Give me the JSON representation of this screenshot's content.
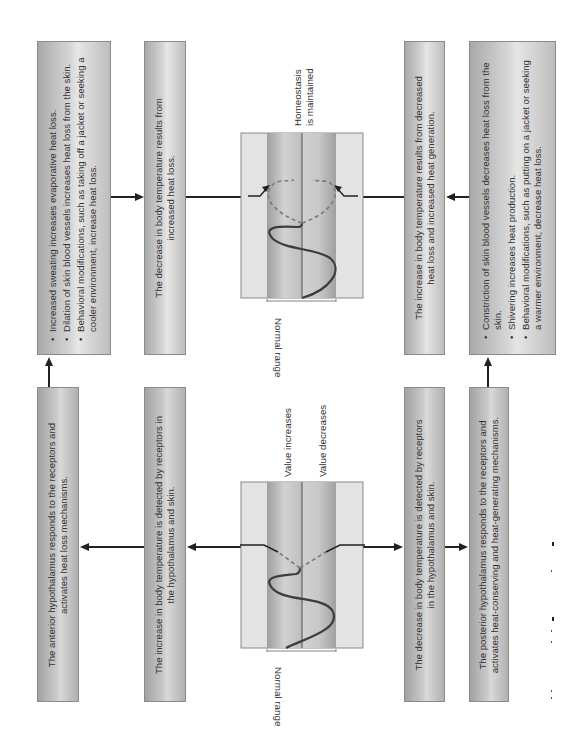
{
  "figure": {
    "left_column_top": {
      "response_box": {
        "bullets": [
          "Increased sweating increases evaporative heat loss.",
          "Dilation of skin blood vessels increases heat loss from the skin.",
          "Behavioral modifications, such as taking off a jacket or seeking a cooler environment, increase heat loss."
        ]
      },
      "result_box": {
        "text": "The decrease in body temperature results from increased heat loss."
      }
    },
    "left_column_bottom": {
      "control_center_box": {
        "text": "The anterior hypothalamus responds to the receptors and activates heat loss mechanisms."
      },
      "receptor_box": {
        "text": "The increase in body temperature is detected by receptors in the hypothalamus and skin."
      }
    },
    "right_column_top": {
      "result_box": {
        "text": "The increase in body temperature results from decreased heat loss and increased heat generation."
      },
      "response_box": {
        "bullets": [
          "Constriction of skin blood vessels decreases heat loss from the skin.",
          "Shivering increases heat production.",
          "Behavioral modifications, such as putting on a jacket or seeking a warmer environment, decrease heat loss."
        ]
      }
    },
    "right_column_bottom": {
      "receptor_box": {
        "text": "The decrease in body temperature is detected by receptors in the hypothalamus and skin."
      },
      "control_center_box": {
        "text": "The posterior hypothalamus responds to the receptors and activates heat-conserving and heat-generating mechanisms."
      }
    },
    "graph_top": {
      "axis_label": "Normal range",
      "annotation_line1": "Homeostasis",
      "annotation_line2": "is maintained"
    },
    "graph_bottom": {
      "axis_label": "Normal range",
      "annotation_increase": "Value increases",
      "annotation_decrease": "Value decreases"
    },
    "colors": {
      "box_border": "#8a8a8a",
      "box_fill_light": "#e6e6e6",
      "box_fill_dark": "#a9a9a9",
      "graph_outer": "#e0e0e0",
      "graph_band": "#a8a8a8",
      "curve": "#3d3d3d",
      "dashed_curve": "#7a7a7a",
      "arrow": "#222222"
    }
  }
}
